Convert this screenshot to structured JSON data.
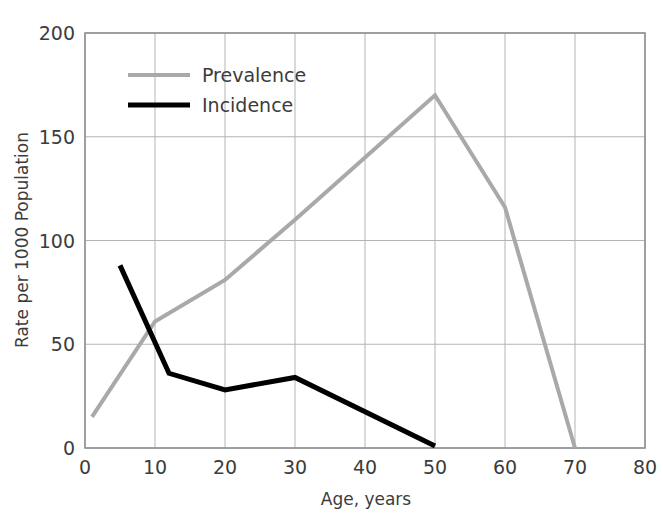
{
  "chart_data": {
    "type": "line",
    "title": "",
    "subtitle": "",
    "xlabel": "Age, years",
    "ylabel": "Rate per 1000 Population",
    "xlim": [
      0,
      80
    ],
    "ylim": [
      0,
      200
    ],
    "xticks": [
      0,
      10,
      20,
      30,
      40,
      50,
      60,
      70,
      80
    ],
    "xtick_labels": [
      "0",
      "10",
      "20",
      "30",
      "40",
      "50",
      "60",
      "70",
      "80"
    ],
    "yticks": [
      0,
      50,
      100,
      150,
      200
    ],
    "ytick_labels": [
      "0",
      "50",
      "100",
      "150",
      "200"
    ],
    "grid": true,
    "legend_position": "upper left (inside axes)",
    "series": [
      {
        "name": "Prevalence",
        "color": "#a9a9a9",
        "linewidth": 4,
        "x": [
          1,
          10,
          20,
          30,
          50,
          60,
          70
        ],
        "y": [
          15,
          61,
          81,
          110,
          170,
          116,
          0
        ]
      },
      {
        "name": "Incidence",
        "color": "#000000",
        "linewidth": 5,
        "x": [
          5,
          12,
          20,
          30,
          50
        ],
        "y": [
          88,
          36,
          28,
          34,
          1
        ]
      }
    ],
    "colors": {
      "prevalence": "#a9a9a9",
      "incidence": "#000000",
      "grid": "#b4b4b4",
      "axis": "#909090",
      "text": "#3c3c3c",
      "background": "#ffffff"
    }
  },
  "legend": {
    "items": [
      {
        "label": "Prevalence",
        "color": "#a9a9a9"
      },
      {
        "label": "Incidence",
        "color": "#000000"
      }
    ]
  },
  "axes": {
    "x_title": "Age, years",
    "y_title": "Rate per 1000 Population",
    "x_tick_labels": [
      "0",
      "10",
      "20",
      "30",
      "40",
      "50",
      "60",
      "70",
      "80"
    ],
    "y_tick_labels": [
      "0",
      "50",
      "100",
      "150",
      "200"
    ]
  }
}
